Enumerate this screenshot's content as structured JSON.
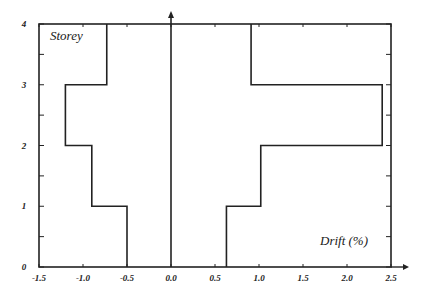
{
  "chart_data": {
    "type": "line",
    "subtype": "step-profile",
    "title": "",
    "xlabel": "Drift (%)",
    "ylabel": "Storey",
    "xlim": [
      -1.5,
      2.5
    ],
    "ylim": [
      0,
      4
    ],
    "x_ticks": [
      -1.5,
      -1.0,
      -0.5,
      0.0,
      0.5,
      1.0,
      1.5,
      2.0,
      2.5
    ],
    "x_tick_labels": [
      "-1.5",
      "-1.0",
      "-0.5",
      "0.0",
      "0.5",
      "1.0",
      "1.5",
      "2.0",
      "2.5"
    ],
    "y_ticks": [
      0,
      1,
      2,
      3,
      4
    ],
    "y_tick_labels": [
      "0",
      "1",
      "2",
      "3",
      "4"
    ],
    "grid": false,
    "legend": null,
    "series": [
      {
        "name": "Negative drift envelope",
        "storeys": [
          1,
          2,
          3,
          4
        ],
        "values": [
          -0.5,
          -0.9,
          -1.2,
          -0.73
        ]
      },
      {
        "name": "Positive drift envelope",
        "storeys": [
          1,
          2,
          3,
          4
        ],
        "values": [
          0.63,
          1.02,
          2.4,
          0.91
        ]
      }
    ],
    "zero_line": 0.0
  }
}
